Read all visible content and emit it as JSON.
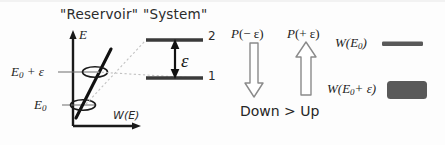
{
  "figure": {
    "width": 445,
    "height": 145,
    "background": "#fdfdfd",
    "ink": "#1a1a1a",
    "grayfill": "#595959",
    "dotted": "#bdbdbd"
  },
  "headings": {
    "reservoir": "\"Reservoir\"",
    "system": "\"System\""
  },
  "reservoir_plot": {
    "y_axis_label": "E",
    "x_axis_label": "W(E)",
    "tick_upper_label_base": "E",
    "tick_upper_label_sub": "0",
    "tick_upper_label_tail": "+ ε",
    "tick_lower_label_base": "E",
    "tick_lower_label_sub": "0",
    "curve_description": "steep-line",
    "marker_count": 2
  },
  "system_levels": {
    "upper_level_label": "2",
    "lower_level_label": "1",
    "gap_label": "ε"
  },
  "transitions": {
    "down_label_fn": "P",
    "down_label_arg": "(− ε)",
    "up_label_fn": "P",
    "up_label_arg": "(+ ε)",
    "comparison": "Down > Up",
    "down_arrow": "arrow-down",
    "up_arrow": "arrow-up"
  },
  "weights": {
    "rows": [
      {
        "label_base": "W(E",
        "label_sub": "0",
        "label_tail": ")",
        "swatch": "thin-bar"
      },
      {
        "label_base": "W(E",
        "label_sub": "0",
        "label_tail": "+ ε)",
        "swatch": "thick-block"
      }
    ]
  }
}
